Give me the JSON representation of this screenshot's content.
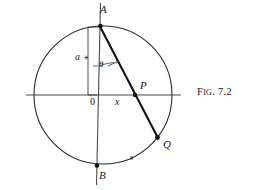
{
  "figure": {
    "caption_prefix": "F",
    "caption_smallcaps": "IG",
    "caption_number": ". 7.2",
    "caption_full": "Fig. 7.2"
  },
  "colors": {
    "stroke": "#1a1a1a",
    "thin_stroke": "#555555",
    "background": "#ffffff"
  },
  "labels": {
    "point_A": "A",
    "point_B": "B",
    "point_P": "P",
    "point_Q": "Q",
    "origin": "0",
    "radius": "a",
    "abscissa": "x",
    "arc": "s",
    "angle": "θ"
  },
  "geometry": {
    "circle": {
      "cx": 103,
      "cy": 95,
      "r": 69
    },
    "points": {
      "A": {
        "x": 103,
        "y": 26
      },
      "B": {
        "x": 97,
        "y": 166
      },
      "P": {
        "x": 135,
        "y": 95
      },
      "Q": {
        "x": 158,
        "y": 138
      },
      "O": {
        "x": 103,
        "y": 95
      }
    },
    "horizontal_axis": {
      "x1": 26,
      "y1": 95,
      "x2": 181,
      "y2": 95
    },
    "vertical_axis": {
      "x1": 100,
      "y1": 3,
      "x2": 96,
      "y2": 185
    },
    "chord": {
      "x1": 100,
      "y1": 26,
      "x2": 158,
      "y2": 138
    },
    "radius_bracket": {
      "x": 88,
      "y_top": 27,
      "y_bottom": 95
    }
  }
}
